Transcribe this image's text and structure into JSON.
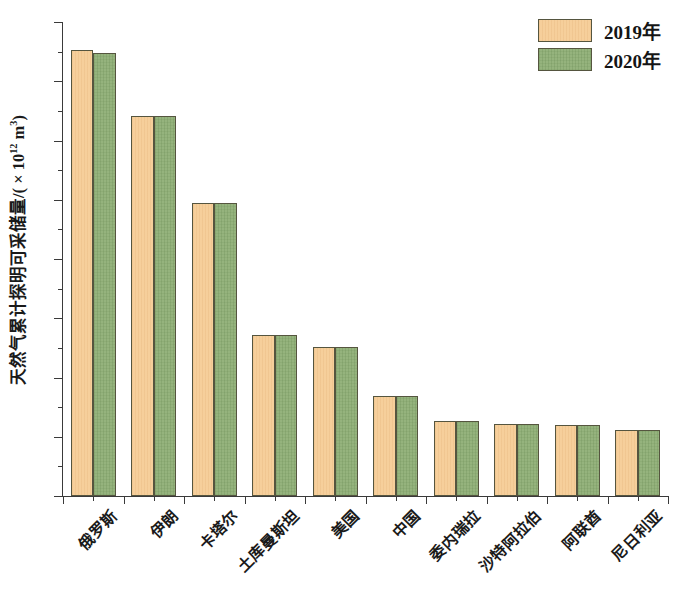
{
  "chart_data": {
    "type": "bar",
    "title": "",
    "xlabel": "",
    "ylabel": "天然气累计探明可采储量/(×10¹² m³)",
    "ylabel_base": "天然气累计探明可采储量/( × 10",
    "ylabel_exp": "12",
    "ylabel_tail": " m",
    "ylabel_tail_exp": "3",
    "ylabel_close": ")",
    "ylim": [
      0,
      40
    ],
    "ytick_step": 5,
    "yminor_step": 2.5,
    "ytick_labels": [
      "0",
      "5",
      "10",
      "15",
      "20",
      "25",
      "30",
      "35",
      "40"
    ],
    "ytick_values": [
      0,
      5,
      10,
      15,
      20,
      25,
      30,
      35,
      40
    ],
    "grid": false,
    "legend_position": "top-right",
    "categories": [
      "俄罗斯",
      "伊朗",
      "卡塔尔",
      "土库曼斯坦",
      "美国",
      "中国",
      "委内瑞拉",
      "沙特阿拉伯",
      "阿联酋",
      "尼日利亚"
    ],
    "series": [
      {
        "name": "2019年",
        "color": "#f6cf9b",
        "values": [
          37.6,
          32.1,
          24.7,
          13.6,
          12.6,
          8.4,
          6.3,
          6.1,
          6.0,
          5.6
        ]
      },
      {
        "name": "2020年",
        "color": "#95b37d",
        "values": [
          37.4,
          32.1,
          24.7,
          13.6,
          12.6,
          8.4,
          6.3,
          6.1,
          6.0,
          5.6
        ]
      }
    ]
  },
  "legend": {
    "items": [
      {
        "label": "2019年",
        "series": "2019"
      },
      {
        "label": "2020年",
        "series": "2020"
      }
    ]
  }
}
